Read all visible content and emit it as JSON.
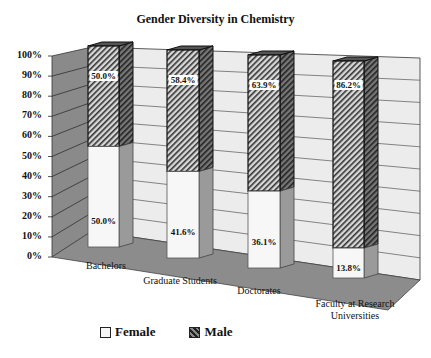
{
  "chart_data": {
    "type": "bar",
    "stacked": true,
    "percent": true,
    "three_d": true,
    "title": "Gender Diversity in Chemistry",
    "xlabel": "",
    "ylabel": "",
    "ylim": [
      0,
      100
    ],
    "y_ticks": [
      "0%",
      "10%",
      "20%",
      "30%",
      "40%",
      "50%",
      "60%",
      "70%",
      "80%",
      "90%",
      "100%"
    ],
    "grid": true,
    "legend_position": "bottom",
    "categories": [
      "Bachelors",
      "Graduate Students",
      "Doctorates",
      "Faculty at Research Universities"
    ],
    "series": [
      {
        "name": "Female",
        "values": [
          50.0,
          41.6,
          36.1,
          13.8
        ],
        "labels": [
          "50.0%",
          "41.6%",
          "36.1%",
          "13.8%"
        ],
        "color": "#f6f6f6"
      },
      {
        "name": "Male",
        "values": [
          50.0,
          58.4,
          63.9,
          86.2
        ],
        "labels": [
          "50.0%",
          "58.4%",
          "63.9%",
          "86.2%"
        ],
        "color": "#555555",
        "pattern": "diagonal-hatch"
      }
    ]
  },
  "legend": {
    "female": "Female",
    "male": "Male"
  },
  "category_lines": [
    [
      "Bachelors"
    ],
    [
      "Graduate Students"
    ],
    [
      "Doctorates"
    ],
    [
      "Faculty at Research",
      "Universities"
    ]
  ]
}
